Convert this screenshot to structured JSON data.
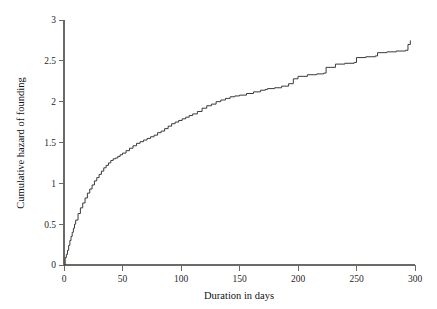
{
  "chart_data": {
    "type": "line",
    "subtype": "step",
    "title": "",
    "xlabel": "Duration in days",
    "ylabel": "Cumulative hazard of founding",
    "xlim": [
      0,
      300
    ],
    "ylim": [
      0,
      3
    ],
    "xticks": [
      0,
      50,
      100,
      150,
      200,
      250,
      300
    ],
    "yticks": [
      0,
      0.5,
      1,
      1.5,
      2,
      2.5,
      3
    ],
    "xtick_labels": [
      "0",
      "50",
      "100",
      "150",
      "200",
      "250",
      "300"
    ],
    "ytick_labels": [
      "0",
      "0.5",
      "1",
      "1.5",
      "2",
      "2.5",
      "3"
    ],
    "grid": false,
    "legend": null,
    "legend_position": "none",
    "series": [
      {
        "name": "Cumulative hazard of founding",
        "color": "#3a3a3a",
        "x": [
          0,
          1,
          2,
          3,
          4,
          5,
          6,
          7,
          8,
          9,
          10,
          12,
          14,
          16,
          18,
          20,
          22,
          24,
          26,
          28,
          30,
          32,
          34,
          36,
          38,
          40,
          42,
          44,
          46,
          48,
          50,
          53,
          56,
          59,
          62,
          65,
          68,
          71,
          74,
          77,
          80,
          83,
          86,
          89,
          92,
          95,
          98,
          101,
          104,
          107,
          110,
          114,
          118,
          122,
          126,
          130,
          134,
          138,
          142,
          146,
          150,
          156,
          162,
          168,
          172,
          174,
          180,
          186,
          192,
          196,
          200,
          208,
          216,
          222,
          224,
          232,
          240,
          248,
          250,
          258,
          266,
          268,
          276,
          284,
          292,
          294,
          296
        ],
        "y": [
          0.0,
          0.09,
          0.13,
          0.18,
          0.24,
          0.3,
          0.35,
          0.4,
          0.45,
          0.5,
          0.55,
          0.63,
          0.7,
          0.76,
          0.82,
          0.88,
          0.93,
          0.98,
          1.03,
          1.07,
          1.11,
          1.15,
          1.19,
          1.22,
          1.25,
          1.28,
          1.3,
          1.31,
          1.33,
          1.35,
          1.37,
          1.4,
          1.43,
          1.46,
          1.49,
          1.51,
          1.53,
          1.55,
          1.57,
          1.59,
          1.62,
          1.64,
          1.67,
          1.7,
          1.73,
          1.75,
          1.77,
          1.79,
          1.81,
          1.83,
          1.85,
          1.88,
          1.92,
          1.95,
          1.97,
          2.0,
          2.02,
          2.04,
          2.06,
          2.07,
          2.08,
          2.1,
          2.12,
          2.14,
          2.15,
          2.16,
          2.17,
          2.19,
          2.22,
          2.28,
          2.31,
          2.33,
          2.34,
          2.35,
          2.42,
          2.46,
          2.47,
          2.48,
          2.54,
          2.55,
          2.56,
          2.6,
          2.61,
          2.62,
          2.63,
          2.7,
          2.75
        ]
      }
    ]
  },
  "axes": {
    "x_title": "Duration in days",
    "y_title": "Cumulative hazard of founding"
  }
}
